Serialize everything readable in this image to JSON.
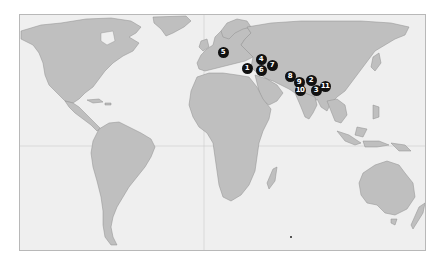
{
  "map": {
    "ocean_color": "#efefef",
    "land_color": "#bfbfbf",
    "border_color": "#8e8e8e",
    "marker_color": "#111111",
    "marker_text_color": "#ffffff"
  },
  "markers": [
    {
      "label": "1",
      "x": 246,
      "y": 67
    },
    {
      "label": "2",
      "x": 310,
      "y": 79
    },
    {
      "label": "3",
      "x": 315,
      "y": 89
    },
    {
      "label": "4",
      "x": 260,
      "y": 58
    },
    {
      "label": "5",
      "x": 222,
      "y": 51
    },
    {
      "label": "6",
      "x": 260,
      "y": 69
    },
    {
      "label": "7",
      "x": 271,
      "y": 64
    },
    {
      "label": "8",
      "x": 289,
      "y": 75
    },
    {
      "label": "9",
      "x": 298,
      "y": 81
    },
    {
      "label": "10",
      "x": 299,
      "y": 89
    },
    {
      "label": "11",
      "x": 324,
      "y": 85
    }
  ]
}
